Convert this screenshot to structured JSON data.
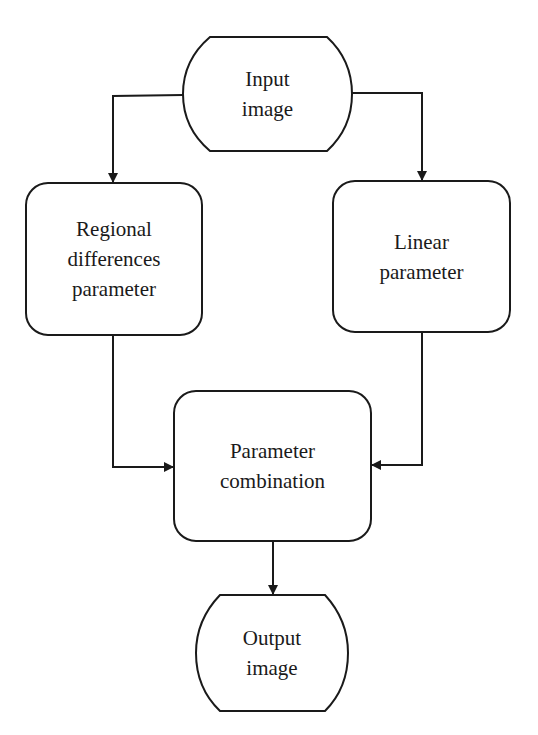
{
  "diagram": {
    "type": "flowchart",
    "nodes": {
      "input": {
        "lines": [
          "Input",
          "image"
        ],
        "shape": "terminal"
      },
      "regional": {
        "lines": [
          "Regional",
          "differences",
          "parameter"
        ],
        "shape": "rounded-rect"
      },
      "linear": {
        "lines": [
          "Linear",
          "parameter"
        ],
        "shape": "rounded-rect"
      },
      "combine": {
        "lines": [
          "Parameter",
          "combination"
        ],
        "shape": "rounded-rect"
      },
      "output": {
        "lines": [
          "Output",
          "image"
        ],
        "shape": "terminal"
      }
    },
    "edges": [
      {
        "from": "input",
        "to": "regional"
      },
      {
        "from": "input",
        "to": "linear"
      },
      {
        "from": "regional",
        "to": "combine"
      },
      {
        "from": "linear",
        "to": "combine"
      },
      {
        "from": "combine",
        "to": "output"
      }
    ],
    "stroke_color": "#1a1a1a"
  }
}
